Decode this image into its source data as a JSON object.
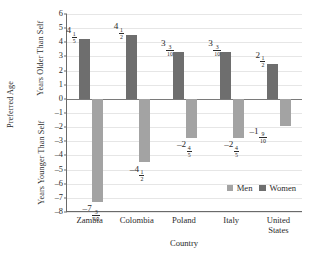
{
  "chart_data": {
    "type": "bar",
    "title": "",
    "xlabel": "Country",
    "ylabel": "Preferred Age",
    "ylabel_upper": "Years Older\nThan Self",
    "ylabel_lower": "Years Younger\nThan Self",
    "categories": [
      "Zambia",
      "Colombia",
      "Poland",
      "Italy",
      "United\nStates"
    ],
    "ylim": [
      -8,
      6
    ],
    "ytick_step": 1,
    "yticks": [
      "6",
      "5",
      "4",
      "3",
      "2",
      "1",
      "0",
      "–1",
      "–2",
      "–3",
      "–4",
      "–5",
      "–6",
      "–7",
      "–8"
    ],
    "grid": true,
    "legend_position": "inside-bottom-right",
    "series": [
      {
        "name": "Men",
        "color": "#a3a3a3",
        "values": [
          -7.3,
          -4.5,
          -2.8,
          -2.8,
          -1.9
        ],
        "labels": [
          {
            "sign": "–",
            "whole": "7",
            "num": "3",
            "den": "10"
          },
          {
            "sign": "–",
            "whole": "4",
            "num": "1",
            "den": "2"
          },
          {
            "sign": "–",
            "whole": "2",
            "num": "4",
            "den": "5"
          },
          {
            "sign": "–",
            "whole": "2",
            "num": "4",
            "den": "5"
          },
          {
            "sign": "–",
            "whole": "1",
            "num": "9",
            "den": "10"
          }
        ]
      },
      {
        "name": "Women",
        "color": "#6e6e6e",
        "values": [
          4.2,
          4.5,
          3.3,
          3.3,
          2.5
        ],
        "labels": [
          {
            "sign": "",
            "whole": "4",
            "num": "1",
            "den": "5"
          },
          {
            "sign": "",
            "whole": "4",
            "num": "1",
            "den": "2"
          },
          {
            "sign": "",
            "whole": "3",
            "num": "3",
            "den": "10"
          },
          {
            "sign": "",
            "whole": "3",
            "num": "3",
            "den": "10"
          },
          {
            "sign": "",
            "whole": "2",
            "num": "1",
            "den": "2"
          }
        ]
      }
    ]
  },
  "legend": {
    "men_label": "Men",
    "women_label": "Women"
  }
}
